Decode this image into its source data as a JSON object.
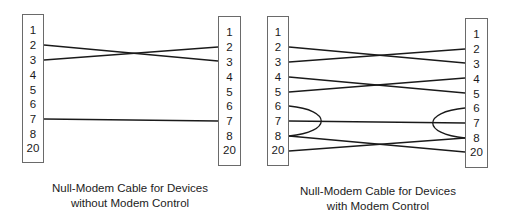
{
  "diagrams": [
    {
      "caption_line1": "Null-Modem Cable for Devices",
      "caption_line2": "without Modem Control",
      "left_pins": [
        "1",
        "2",
        "3",
        "4",
        "5",
        "6",
        "7",
        "8",
        "20"
      ],
      "right_pins": [
        "1",
        "2",
        "3",
        "4",
        "5",
        "6",
        "7",
        "8",
        "20"
      ],
      "connections": [
        "2-3",
        "3-2",
        "7-7"
      ]
    },
    {
      "caption_line1": "Null-Modem Cable for Devices",
      "caption_line2": "with Modem Control",
      "left_pins": [
        "1",
        "2",
        "3",
        "4",
        "5",
        "6",
        "7",
        "8",
        "20"
      ],
      "right_pins": [
        "1",
        "2",
        "3",
        "4",
        "5",
        "6",
        "7",
        "8",
        "20"
      ],
      "connections": [
        "2-3",
        "3-2",
        "4-5",
        "5-4",
        "7-7",
        "8-20",
        "20-8"
      ],
      "loops": [
        "left 6-8",
        "right 6-8"
      ]
    }
  ],
  "colors": {
    "line": "#1a1a1a",
    "box_border": "#6a6a6a"
  }
}
